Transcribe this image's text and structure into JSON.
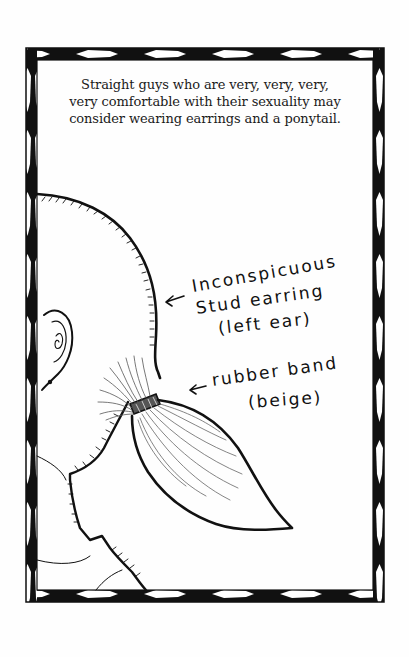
{
  "caption": {
    "lines": [
      "Straight guys who are very, very, very,",
      "very comfortable with their sexuality may",
      "consider wearing earrings and a ponytail."
    ]
  },
  "annotations": [
    {
      "id": "earring",
      "arrow": "←",
      "lines": [
        "Inconspicuous",
        "Stud earring",
        "(left ear)"
      ]
    },
    {
      "id": "rubber-band",
      "arrow": "←",
      "lines": [
        "rubber band",
        "(beige)"
      ]
    }
  ],
  "colors": {
    "ink": "#111111",
    "paper": "#fefefe",
    "hair_strand": "#555555"
  }
}
